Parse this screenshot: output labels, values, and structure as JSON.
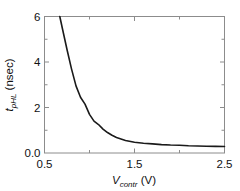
{
  "chart_data": {
    "type": "line",
    "title": "",
    "xlabel": "V_contr (V)",
    "ylabel": "t_pHL (nsec)",
    "xlabel_main": "V",
    "xlabel_sub": "contr",
    "xlabel_unit": " (V)",
    "ylabel_main": "t",
    "ylabel_sub": "pHL",
    "ylabel_unit": " (nsec)",
    "xlim": [
      0.5,
      2.5
    ],
    "ylim": [
      0.0,
      6.0
    ],
    "grid": false,
    "legend": null,
    "xticks": [
      0.5,
      1.5,
      2.5
    ],
    "xtick_labels": [
      "0.5",
      "1.5",
      "2.5"
    ],
    "xminor_ticks": [
      1.0,
      2.0
    ],
    "yticks": [
      0.0,
      2.0,
      4.0,
      6.0
    ],
    "ytick_labels": [
      "0.0",
      "2",
      "4",
      "6"
    ],
    "yminor_ticks": [
      1.0,
      3.0,
      5.0
    ],
    "series": [
      {
        "name": "t_pHL vs V_contr",
        "color": "#1a1a1a",
        "x": [
          0.67,
          0.7,
          0.75,
          0.8,
          0.85,
          0.9,
          0.95,
          1.0,
          1.05,
          1.1,
          1.15,
          1.2,
          1.25,
          1.3,
          1.4,
          1.5,
          1.6,
          1.7,
          1.8,
          1.9,
          2.0,
          2.1,
          2.2,
          2.3,
          2.4,
          2.5
        ],
        "y": [
          6.0,
          5.45,
          4.55,
          3.7,
          2.95,
          2.45,
          2.15,
          1.7,
          1.4,
          1.25,
          1.05,
          0.9,
          0.78,
          0.68,
          0.55,
          0.47,
          0.43,
          0.4,
          0.37,
          0.35,
          0.34,
          0.32,
          0.31,
          0.3,
          0.29,
          0.285
        ]
      }
    ]
  },
  "colors": {
    "curve": "#1a1a1a",
    "frame": "#8c8c8c",
    "text": "#111111",
    "background": "#ffffff"
  }
}
